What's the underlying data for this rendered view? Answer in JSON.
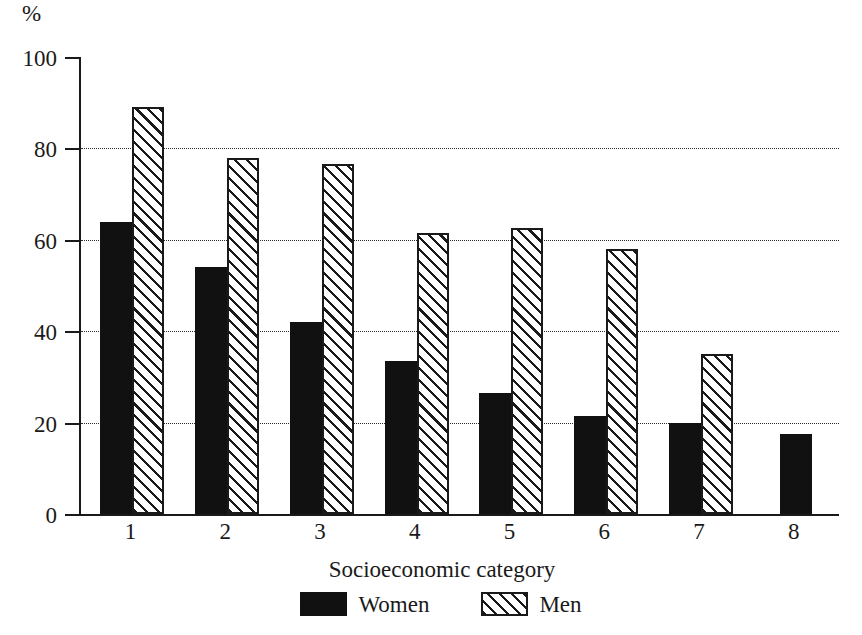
{
  "chart_data": {
    "type": "bar",
    "title": "",
    "subtitle": "",
    "xlabel": "Socioeconomic category",
    "ylabel": "%",
    "unit_label": "%",
    "categories": [
      "1",
      "2",
      "3",
      "4",
      "5",
      "6",
      "7",
      "8"
    ],
    "series": [
      {
        "name": "Women",
        "style": "solid-black",
        "color": "#111111",
        "values": [
          64,
          54,
          42,
          33.5,
          26.5,
          21.5,
          20,
          17.5
        ]
      },
      {
        "name": "Men",
        "style": "diagonal-hatch",
        "color": "#1a1a1a",
        "values": [
          89,
          78,
          76.5,
          61.5,
          62.5,
          58,
          35,
          null
        ]
      }
    ],
    "ylim": [
      0,
      100
    ],
    "yticks": [
      0,
      20,
      40,
      60,
      80,
      100
    ],
    "ytick_labels": [
      "0",
      "20",
      "40",
      "60",
      "80",
      "100"
    ],
    "gridlines": [
      20,
      40,
      60,
      80
    ],
    "grid": "horizontal-dotted",
    "legend_position": "bottom-center"
  },
  "legend": {
    "items": [
      {
        "label": "Women",
        "style": "solid-black"
      },
      {
        "label": "Men",
        "style": "diagonal-hatch"
      }
    ]
  }
}
